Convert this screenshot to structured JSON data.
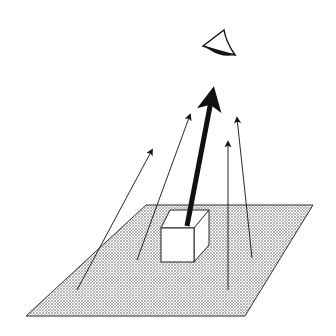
{
  "diagram": {
    "colors": {
      "background": "#ffffff",
      "ink": "#111111",
      "plane_fill": "#bdbdbd"
    },
    "eye": {
      "icon": "eye-icon",
      "position": [
        220,
        48
      ]
    },
    "plane": {
      "corners": [
        [
          146,
          205
        ],
        [
          313,
          205
        ],
        [
          245,
          316
        ],
        [
          26,
          316
        ]
      ]
    },
    "cube": {
      "front_face": [
        [
          161,
          228
        ],
        [
          194,
          228
        ],
        [
          194,
          262
        ],
        [
          161,
          262
        ]
      ],
      "top_back": [
        [
          170,
          210
        ],
        [
          209,
          210
        ]
      ]
    },
    "main_ray": {
      "from": [
        187,
        226
      ],
      "to": [
        213,
        88
      ],
      "width": 5
    },
    "rays": [
      {
        "from": [
          77,
          290
        ],
        "to": [
          152,
          150
        ]
      },
      {
        "from": [
          137,
          260
        ],
        "to": [
          190,
          115
        ]
      },
      {
        "from": [
          228,
          290
        ],
        "to": [
          228,
          142
        ]
      },
      {
        "from": [
          252,
          258
        ],
        "to": [
          237,
          118
        ]
      }
    ]
  }
}
